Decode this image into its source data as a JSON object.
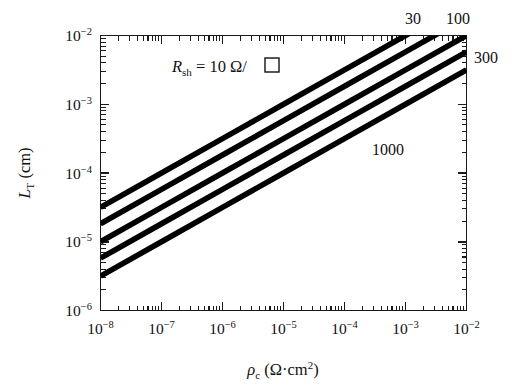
{
  "chart_data": {
    "type": "line",
    "title": "",
    "xlabel": "ρc (Ω·cm²)",
    "ylabel": "LT (cm)",
    "xscale": "log",
    "yscale": "log",
    "xlim": [
      1e-08,
      0.01
    ],
    "ylim": [
      1e-06,
      0.01
    ],
    "grid": false,
    "legend_position": "inline-curve-labels",
    "xlabel_parts": {
      "symbol": "ρ",
      "subscript": "c",
      "units": "(Ω·cm",
      "units_sup": "2",
      "units_close": ")"
    },
    "ylabel_parts": {
      "symbol": "L",
      "subscript": "T",
      "units": "(cm)"
    },
    "annotation": {
      "symbol": "R",
      "subscript": "sh",
      "equals": "= 10 Ω/",
      "box_icon": "square-symbol"
    },
    "x_tick_labels": [
      "10−8",
      "10−7",
      "10−6",
      "10−5",
      "10−4",
      "10−3",
      "10−2"
    ],
    "x_tick_exponents": [
      "-8",
      "-7",
      "-6",
      "-5",
      "-4",
      "-3",
      "-2"
    ],
    "x_tick_mantissa": "10",
    "y_tick_labels": [
      "10−2",
      "10−3",
      "10−4",
      "10−5",
      "10−6"
    ],
    "y_tick_exponents": [
      "-2",
      "-3",
      "-4",
      "-5",
      "-6"
    ],
    "y_tick_mantissa": "10",
    "series": [
      {
        "name": "10",
        "label": "10",
        "label_position": "inline-annotation",
        "R_sh": 10,
        "x": [
          1e-08,
          1e-07,
          1e-06,
          1e-05,
          0.0001,
          0.001,
          0.01
        ],
        "values": [
          3.16e-05,
          0.0001,
          0.000316,
          0.001,
          0.00316,
          0.01,
          0.0316
        ]
      },
      {
        "name": "30",
        "label": "30",
        "label_position": "top",
        "R_sh": 30,
        "x": [
          1e-08,
          1e-07,
          1e-06,
          1e-05,
          0.0001,
          0.001,
          0.01
        ],
        "values": [
          1.83e-05,
          5.77e-05,
          0.000183,
          0.000577,
          0.00183,
          0.00577,
          0.0183
        ]
      },
      {
        "name": "100",
        "label": "100",
        "label_position": "top-right",
        "R_sh": 100,
        "x": [
          1e-08,
          1e-07,
          1e-06,
          1e-05,
          0.0001,
          0.001,
          0.01
        ],
        "values": [
          1e-05,
          3.16e-05,
          0.0001,
          0.000316,
          0.001,
          0.00316,
          0.01
        ]
      },
      {
        "name": "300",
        "label": "300",
        "label_position": "right",
        "R_sh": 300,
        "x": [
          1e-08,
          1e-07,
          1e-06,
          1e-05,
          0.0001,
          0.001,
          0.01
        ],
        "values": [
          5.77e-06,
          1.83e-05,
          5.77e-05,
          0.000183,
          0.000577,
          0.00183,
          0.00577
        ]
      },
      {
        "name": "1000",
        "label": "1000",
        "label_position": "inside-right",
        "R_sh": 1000,
        "x": [
          1e-08,
          1e-07,
          1e-06,
          1e-05,
          0.0001,
          0.001,
          0.01
        ],
        "values": [
          3.16e-06,
          1e-05,
          3.16e-05,
          0.0001,
          0.000316,
          0.001,
          0.00316
        ]
      }
    ],
    "curve_labels": [
      "30",
      "100",
      "300",
      "1000"
    ]
  },
  "colors": {
    "line": "#000000",
    "axis": "#1a1a1a",
    "background": "#ffffff",
    "text": "#111111"
  }
}
